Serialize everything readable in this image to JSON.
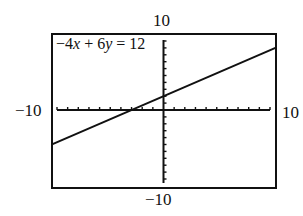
{
  "chart_data": {
    "type": "line",
    "title": "",
    "equation_label": "−4x + 6y = 12",
    "equation": {
      "a": -4,
      "b": 6,
      "c": 12,
      "slope": 0.6667,
      "intercept": 2
    },
    "series": [
      {
        "name": "−4x + 6y = 12",
        "x": [
          -10,
          10
        ],
        "y": [
          -4.667,
          8.667
        ]
      }
    ],
    "window": {
      "xmin": -10,
      "xmax": 10,
      "ymin": -10,
      "ymax": 10
    },
    "xlim": [
      -10,
      10
    ],
    "ylim": [
      -10,
      10
    ],
    "xlabel": "",
    "ylabel": "",
    "tick_labels": {
      "top": "10",
      "bottom": "−10",
      "left": "−10",
      "right": "10"
    },
    "x_ticks_step": 1,
    "y_ticks_step": 1,
    "grid": false,
    "legend": "none"
  },
  "labels": {
    "ymax": "10",
    "ymin": "−10",
    "xmin": "−10",
    "xmax": "10",
    "eq_prefix": "−4",
    "eq_x": "x",
    "eq_mid": " + 6",
    "eq_y": "y",
    "eq_suffix": " = 12"
  }
}
